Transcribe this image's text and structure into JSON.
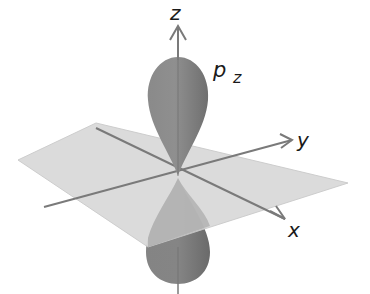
{
  "figure": {
    "orbital_label": "p",
    "orbital_subscript": "z",
    "axes": {
      "z": "z",
      "y": "y",
      "x": "x"
    }
  },
  "colors": {
    "plane": "#d6d6d6",
    "plane_edge": "#c8c8c8",
    "axis": "#7a7a7a",
    "lobe": "#7f7f7f",
    "lobe_dark": "#6a6a6a",
    "text": "#1a1a1a"
  }
}
